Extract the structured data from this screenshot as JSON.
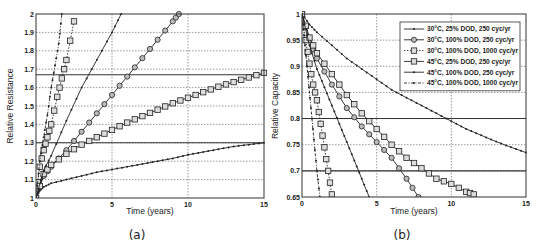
{
  "chart_data": [
    {
      "id": "a",
      "type": "line",
      "caption": "(a)",
      "xlabel": "Time (years)",
      "ylabel": "Relative Resistance",
      "xlim": [
        0,
        15
      ],
      "ylim": [
        1,
        2
      ],
      "xticks": [
        0,
        5,
        10,
        15
      ],
      "yticks": [
        1,
        1.1,
        1.2,
        1.3,
        1.4,
        1.5,
        1.6,
        1.7,
        1.8,
        1.9,
        2
      ],
      "ytick_labels": [
        "1",
        "1.1",
        "1.2",
        "1.3",
        "1.4",
        "1.5",
        "1.6",
        "1.7",
        "1.8",
        "1.9",
        "2"
      ],
      "xtick_labels": [
        "0",
        "5",
        "10",
        "15"
      ],
      "grid": true,
      "threshold_lines": [
        1.3,
        1.67
      ],
      "series": [
        {
          "name": "30°C, 25% DOD, 250 cyc/yr",
          "marker": "dot",
          "dash": "solid",
          "x": [
            0,
            0.25,
            0.5,
            1,
            2,
            3,
            4,
            5,
            6,
            7,
            8,
            9,
            10,
            11,
            12,
            13,
            14,
            15
          ],
          "y": [
            1,
            1.04,
            1.06,
            1.08,
            1.1,
            1.12,
            1.14,
            1.155,
            1.17,
            1.185,
            1.2,
            1.215,
            1.235,
            1.25,
            1.265,
            1.28,
            1.29,
            1.3
          ]
        },
        {
          "name": "30°C, 100% DOD, 250 cyc/yr",
          "marker": "circle",
          "dash": "solid",
          "x": [
            0,
            0.5,
            1,
            2,
            3,
            4,
            5,
            6,
            7,
            8,
            9,
            9.4
          ],
          "y": [
            1,
            1.12,
            1.17,
            1.26,
            1.36,
            1.46,
            1.56,
            1.66,
            1.76,
            1.86,
            1.96,
            2.0
          ]
        },
        {
          "name": "30°C, 100% DOD, 1000 cyc/yr",
          "marker": "square",
          "dash": "dotted",
          "x": [
            0,
            0.25,
            0.5,
            0.75,
            1,
            1.4,
            1.7,
            2.0,
            2.5
          ],
          "y": [
            1,
            1.17,
            1.26,
            1.33,
            1.4,
            1.55,
            1.65,
            1.75,
            1.96
          ]
        },
        {
          "name": "45°C, 25% DOD, 250 cyc/yr",
          "marker": "square",
          "dash": "solid",
          "x": [
            0,
            0.5,
            1,
            2,
            3,
            4,
            5,
            6,
            7,
            8,
            9,
            10,
            11,
            12,
            13,
            14,
            15
          ],
          "y": [
            1,
            1.13,
            1.18,
            1.24,
            1.29,
            1.33,
            1.37,
            1.41,
            1.445,
            1.48,
            1.515,
            1.545,
            1.575,
            1.605,
            1.63,
            1.655,
            1.68
          ]
        },
        {
          "name": "45°C, 100% DOD, 250 cyc/yr",
          "marker": "dot",
          "dash": "solid",
          "x": [
            0,
            0.5,
            1,
            2,
            3,
            4,
            5,
            5.6
          ],
          "y": [
            1,
            1.15,
            1.23,
            1.42,
            1.6,
            1.75,
            1.9,
            2.0
          ]
        },
        {
          "name": "45°C, 100% DOD, 1000 cyc/yr",
          "marker": "dot",
          "dash": "dashdot",
          "x": [
            0,
            0.25,
            0.5,
            0.75,
            1,
            1.25,
            1.5,
            1.7
          ],
          "y": [
            1,
            1.2,
            1.33,
            1.45,
            1.6,
            1.72,
            1.84,
            2.0
          ]
        }
      ]
    },
    {
      "id": "b",
      "type": "line",
      "caption": "(b)",
      "xlabel": "Time (years)",
      "ylabel": "Relative Capacity",
      "xlim": [
        0,
        15
      ],
      "ylim": [
        0.65,
        1
      ],
      "xticks": [
        0,
        5,
        10,
        15
      ],
      "yticks": [
        0.65,
        0.7,
        0.75,
        0.8,
        0.85,
        0.9,
        0.95,
        1
      ],
      "ytick_labels": [
        "0.65",
        "0.7",
        "0.75",
        "0.8",
        "0.85",
        "0.9",
        "0.95",
        "1"
      ],
      "xtick_labels": [
        "0",
        "5",
        "10",
        "15"
      ],
      "grid": true,
      "threshold_lines": [
        0.7,
        0.8
      ],
      "legend_position": "upper right",
      "series": [
        {
          "name": "30°C, 25% DOD, 250 cyc/yr",
          "marker": "dot",
          "dash": "solid",
          "x": [
            0,
            0.5,
            1,
            2,
            3,
            4,
            5,
            6,
            7,
            8,
            9,
            10,
            11,
            12,
            13,
            14,
            15
          ],
          "y": [
            1,
            0.98,
            0.965,
            0.94,
            0.915,
            0.895,
            0.875,
            0.855,
            0.84,
            0.825,
            0.81,
            0.795,
            0.78,
            0.768,
            0.756,
            0.745,
            0.735
          ]
        },
        {
          "name": "30°C, 100% DOD, 250 cyc/yr",
          "marker": "circle",
          "dash": "solid",
          "x": [
            0,
            0.5,
            1,
            2,
            3,
            4,
            5,
            6,
            7,
            7.8
          ],
          "y": [
            1,
            0.95,
            0.915,
            0.865,
            0.82,
            0.785,
            0.755,
            0.725,
            0.685,
            0.65
          ]
        },
        {
          "name": "30°C, 100% DOD, 1000 cyc/yr",
          "marker": "square",
          "dash": "dotted",
          "x": [
            0,
            0.25,
            0.5,
            0.75,
            1,
            1.25,
            1.5,
            1.75,
            2.0
          ],
          "y": [
            1,
            0.95,
            0.905,
            0.865,
            0.835,
            0.79,
            0.745,
            0.7,
            0.655
          ]
        },
        {
          "name": "45°C, 25% DOD, 250 cyc/yr",
          "marker": "square",
          "dash": "solid",
          "x": [
            0,
            0.5,
            1,
            2,
            3,
            4,
            5,
            6,
            7,
            8,
            9,
            10,
            11,
            11.5
          ],
          "y": [
            1,
            0.955,
            0.925,
            0.885,
            0.845,
            0.81,
            0.78,
            0.75,
            0.725,
            0.705,
            0.685,
            0.675,
            0.66,
            0.655
          ]
        },
        {
          "name": "45°C, 100% DOD, 250 cyc/yr",
          "marker": "dot",
          "dash": "solid",
          "x": [
            0,
            0.5,
            1,
            1.5,
            2,
            2.5,
            3,
            3.5,
            4,
            4.5
          ],
          "y": [
            1,
            0.94,
            0.895,
            0.86,
            0.825,
            0.79,
            0.755,
            0.72,
            0.685,
            0.65
          ]
        },
        {
          "name": "45°C, 100% DOD, 1000 cyc/yr",
          "marker": "dot",
          "dash": "dashdot",
          "x": [
            0,
            0.2,
            0.4,
            0.6,
            0.8,
            1.0,
            1.2
          ],
          "y": [
            1,
            0.94,
            0.88,
            0.82,
            0.76,
            0.7,
            0.65
          ]
        }
      ]
    }
  ],
  "legend": {
    "items": [
      "30°C, 25% DOD, 250 cyc/yr",
      "30°C, 100% DOD, 250 cyc/yr",
      "30°C, 100% DOD, 1000 cyc/yr",
      "45°C, 25% DOD, 250 cyc/yr",
      "45°C, 100% DOD, 250 cyc/yr",
      "45°C, 100% DOD, 1000 cyc/yr"
    ]
  },
  "colors": {
    "line": "#222222",
    "grid": "#444444",
    "background": "#ffffff"
  }
}
